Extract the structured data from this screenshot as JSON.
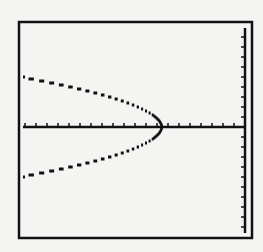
{
  "window": {
    "title": ""
  },
  "colors": {
    "background": "#f4f4f2",
    "ink": "#111111"
  },
  "chart_data": {
    "type": "line",
    "title": "",
    "xlabel": "",
    "ylabel": "",
    "equation_form": "x = h - a*y^2",
    "x_tick_count": 20,
    "y_tick_count": 22,
    "x_tick_spacing_units": 1,
    "y_tick_spacing_units": 1,
    "xlim": [
      -20,
      0
    ],
    "ylim": [
      -10,
      11
    ],
    "vertex": {
      "x": -7.5,
      "y": 0
    },
    "grid": false,
    "legend": null,
    "series": [
      {
        "name": "upper branch",
        "x": [
          -20,
          -17.5,
          -15,
          -12.5,
          -10,
          -8.5,
          -7.5
        ],
        "y": [
          4.7,
          4.1,
          3.5,
          2.8,
          2.0,
          1.2,
          0
        ]
      },
      {
        "name": "lower branch",
        "x": [
          -20,
          -17.5,
          -15,
          -12.5,
          -10,
          -8.5,
          -7.5
        ],
        "y": [
          -4.7,
          -4.1,
          -3.5,
          -2.8,
          -2.0,
          -1.2,
          0
        ]
      }
    ],
    "layout": {
      "frame": {
        "left": 19,
        "top": 22,
        "right": 252,
        "bottom": 238
      },
      "y_axis_px": 245,
      "x_axis_px": 127,
      "vertex_px": 161,
      "half_height_px": 50,
      "x_tick_px": 11,
      "y_tick_px": 10
    }
  }
}
